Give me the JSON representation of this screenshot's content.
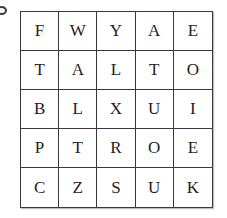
{
  "corner_icon": "circle-mark-icon",
  "grid": {
    "rows": [
      [
        "F",
        "W",
        "Y",
        "A",
        "E"
      ],
      [
        "T",
        "A",
        "L",
        "T",
        "O"
      ],
      [
        "B",
        "L",
        "X",
        "U",
        "I"
      ],
      [
        "P",
        "T",
        "R",
        "O",
        "E"
      ],
      [
        "C",
        "Z",
        "S",
        "U",
        "K"
      ]
    ]
  }
}
